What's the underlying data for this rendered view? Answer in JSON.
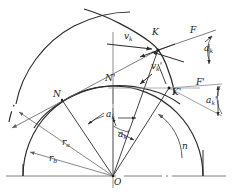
{
  "figure": {
    "kind": "involute-gear-velocity-diagram",
    "width": 232,
    "height": 196,
    "line_color": "#2b2b2b",
    "thin_color": "#6a6a6a",
    "text_color": "#1a1a1a"
  },
  "labels": {
    "center": "O",
    "point_K": "K",
    "point_K_prime": "K'",
    "point_N": "N",
    "point_N_prime": "N'",
    "force_F": "F",
    "force_F_prime": "F'",
    "velocity_vk": "v",
    "velocity_vk_sub": "k",
    "velocity_vk_prime": "v",
    "velocity_vk_prime_sub": "k",
    "angle_ak_top": "a",
    "angle_ak_top_sub": "k",
    "angle_ak_prime_top": "a",
    "angle_ak_prime_top_sub": "k",
    "angle_ak_center": "a",
    "angle_ak_center_sub": "k",
    "angle_ak_prime_center": "a",
    "angle_ak_prime_center_sub": "k",
    "radius_ra": "r",
    "radius_ra_sub": "a",
    "radius_rb": "r",
    "radius_rb_sub": "b",
    "rotation_n": "n",
    "prime": "'"
  },
  "geometry": {
    "center": {
      "x": 113,
      "y": 176
    },
    "base_circle_radius": 90,
    "outer_arc_label": "involute-profile",
    "baseline_y": 176,
    "baseline_x1": 6,
    "baseline_x2": 226,
    "axis_top_y": 32,
    "K": {
      "x": 158,
      "y": 50
    },
    "K_prime": {
      "x": 168,
      "y": 88
    },
    "N": {
      "x": 62,
      "y": 100
    },
    "N_prime": {
      "x": 113,
      "y": 86
    }
  }
}
